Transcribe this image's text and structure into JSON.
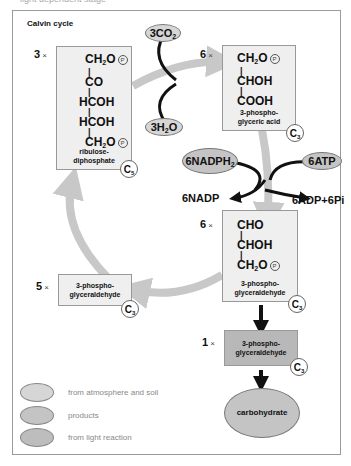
{
  "header": {
    "caption": "light dependent stage",
    "title": "Calvin cycle"
  },
  "inputs": {
    "co2": {
      "coef": "3CO",
      "sub": "2"
    },
    "h2o": {
      "pre": "3H",
      "sub": "2",
      "post": "O"
    },
    "nadph": {
      "coef": "6NADPH",
      "sub": "2"
    },
    "atp": "6ATP",
    "nadp": "6NADP",
    "adp": "6ADP+6Pi"
  },
  "molecules": {
    "ribulose": {
      "multiplier": "3",
      "lines": [
        "CH2O",
        "CO",
        "HCOH",
        "HCOH",
        "CH2O"
      ],
      "name_1": "ribulose-",
      "name_2": "diphosphate",
      "carbons": "5"
    },
    "pga": {
      "multiplier": "6",
      "name_1": "3-phospho-",
      "name_2": "glyceric acid",
      "carbons": "3"
    },
    "pgal6": {
      "multiplier": "6",
      "name_1": "3-phospho-",
      "name_2": "glyceraldehyde",
      "carbons": "3"
    },
    "pgal5": {
      "multiplier": "5",
      "name_1": "3-phospho-",
      "name_2": "glyceraldehyde",
      "carbons": "3"
    },
    "pgal1": {
      "multiplier": "1",
      "name_1": "3-phospho-",
      "name_2": "glyceraldehyde",
      "carbons": "3"
    },
    "carbohydrate": "carbohydrate"
  },
  "formula_text": {
    "ch2o": "CH",
    "ch2o_sub": "2",
    "ch2o_post": "O",
    "co": "CO",
    "hcoh": "HCOH",
    "chohl": "CHOH",
    "cooh": "COOH",
    "cho": "CHO",
    "p": "P",
    "times": "×",
    "c": "C"
  },
  "legend": [
    {
      "label": "from atmosphere and soil",
      "color": "#d6d6d6"
    },
    {
      "label": "products",
      "color": "#c4c4c4"
    },
    {
      "label": "from light reaction",
      "color": "#bdbdbd"
    }
  ],
  "colors": {
    "cycle_arrow": "#c8c8c8",
    "black_arrow": "#111111",
    "box": "#efefef",
    "dark_box": "#b8b8b8"
  }
}
